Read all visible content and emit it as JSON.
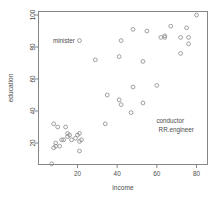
{
  "chart_data": {
    "type": "scatter",
    "title": "",
    "xlabel": "income",
    "ylabel": "education",
    "xlim": [
      0,
      85
    ],
    "ylim": [
      5,
      102
    ],
    "grid": false,
    "legend": "none",
    "marker": "open-circle",
    "marker_color": "#8f8f8f",
    "xticks": [
      20,
      40,
      60,
      80
    ],
    "yticks": [
      20,
      40,
      60,
      80,
      100
    ],
    "x": [
      62,
      72,
      75,
      55,
      64,
      21,
      64,
      80,
      76,
      48,
      76,
      53,
      42,
      67,
      29,
      41,
      34,
      72,
      48,
      60,
      42,
      47,
      53,
      8,
      10,
      35,
      41,
      12,
      17,
      19,
      9,
      21,
      16,
      21,
      20,
      7,
      21,
      14,
      15,
      22,
      15,
      9,
      11,
      8,
      13
    ],
    "y": [
      86,
      76,
      92,
      90,
      86,
      84,
      87,
      100,
      86,
      91,
      82,
      71,
      84,
      93,
      72,
      74,
      32,
      86,
      55,
      56,
      44,
      39,
      45,
      32,
      30,
      50,
      47,
      22,
      22,
      23,
      18,
      21,
      25,
      15,
      25,
      7,
      26,
      30,
      24,
      22,
      26,
      20,
      18,
      17,
      22
    ],
    "labels": [
      {
        "text": "minister",
        "x": 21,
        "y": 84
      },
      {
        "text": "conductor",
        "x": 76,
        "y": 34
      },
      {
        "text": "RR.engineer",
        "x": 81,
        "y": 28
      }
    ]
  },
  "axes": {
    "x_title": "income",
    "y_title": "education",
    "x_tick_labels": [
      "20",
      "40",
      "60",
      "80"
    ],
    "y_tick_labels": [
      "20",
      "40",
      "60",
      "80",
      "100"
    ]
  },
  "annotations": {
    "minister": "minister",
    "conductor": "conductor",
    "rr_engineer": "RR.engineer"
  }
}
